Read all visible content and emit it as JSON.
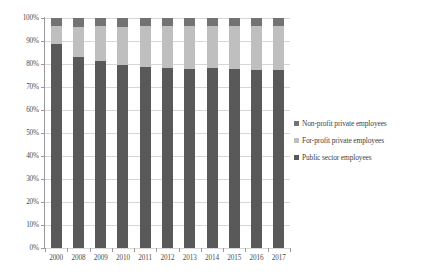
{
  "chart_data": {
    "type": "bar",
    "subtype": "stacked-percentage-column",
    "title": "",
    "xlabel": "",
    "ylabel": "",
    "ylim": [
      0,
      100
    ],
    "ytick_labels": [
      "0%",
      "10%",
      "20%",
      "30%",
      "40%",
      "50%",
      "60%",
      "70%",
      "80%",
      "90%",
      "100%"
    ],
    "ytick_values": [
      0,
      10,
      20,
      30,
      40,
      50,
      60,
      70,
      80,
      90,
      100
    ],
    "grid": true,
    "legend_position": "right",
    "categories": [
      "2000",
      "2008",
      "2009",
      "2010",
      "2011",
      "2012",
      "2013",
      "2014",
      "2015",
      "2016",
      "2017"
    ],
    "series": [
      {
        "name": "Public sector employees",
        "color": "#595959",
        "values": [
          88.6,
          83.0,
          81.5,
          79.6,
          78.8,
          78.3,
          77.9,
          78.4,
          77.8,
          77.4,
          77.3
        ]
      },
      {
        "name": "For-profit private employees",
        "color": "#bfbfbf",
        "values": [
          8.0,
          13.3,
          14.9,
          16.7,
          17.6,
          18.2,
          18.5,
          18.0,
          18.6,
          19.0,
          19.1
        ]
      },
      {
        "name": "Non-profit private employees",
        "color": "#737373",
        "values": [
          3.4,
          3.7,
          3.6,
          3.7,
          3.6,
          3.5,
          3.6,
          3.6,
          3.6,
          3.6,
          3.6
        ]
      }
    ]
  },
  "legend": {
    "items": [
      {
        "label": "Non-profit private employees",
        "color": "#737373"
      },
      {
        "label": "For-profit private employees",
        "color": "#bfbfbf"
      },
      {
        "label": "Public sector employees",
        "color": "#595959"
      }
    ]
  }
}
